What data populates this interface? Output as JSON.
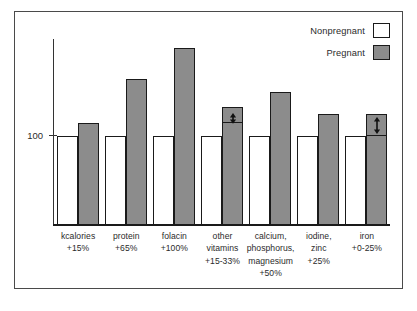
{
  "chart_data": {
    "type": "bar",
    "title": "",
    "subtitle": "",
    "xlabel": "",
    "ylabel": "",
    "ylim": [
      0,
      210
    ],
    "grid": false,
    "legend_position": "top-right",
    "y_ticks": [
      {
        "value": 100,
        "label": "100"
      }
    ],
    "baseline_value": 100,
    "categories": [
      "kcalories",
      "protein",
      "folacin",
      "other vitamins",
      "calcium, phosphorus, magnesium",
      "iodine, zinc",
      "iron"
    ],
    "series": [
      {
        "name": "Nonpregnant",
        "color": "#ffffff",
        "values": [
          100,
          100,
          100,
          100,
          100,
          100,
          100
        ]
      },
      {
        "name": "Pregnant",
        "color": "#8c8c8c",
        "values": [
          115,
          165,
          200,
          133,
          150,
          125,
          125
        ],
        "value_ranges": [
          null,
          null,
          null,
          [
            115,
            133
          ],
          null,
          null,
          [
            100,
            125
          ]
        ]
      }
    ],
    "increase_labels": [
      "+15%",
      "+65%",
      "+100%",
      "+15-33%",
      "+50%",
      "+25%",
      "+0-25%"
    ],
    "annotations": [
      {
        "category": "other vitamins",
        "type": "double-headed-arrow",
        "range": [
          115,
          133
        ],
        "note": "+15-33%"
      },
      {
        "category": "iron",
        "type": "double-headed-arrow",
        "range": [
          100,
          125
        ],
        "note": "+0-25%"
      }
    ]
  },
  "legend": {
    "items": [
      {
        "label": "Nonpregnant",
        "swatch": "white"
      },
      {
        "label": "Pregnant",
        "swatch": "gray"
      }
    ]
  },
  "axis": {
    "y_tick_label": "100"
  },
  "x_categories": [
    {
      "line1": "kcalories",
      "line2": "+15%",
      "line3": "",
      "line4": ""
    },
    {
      "line1": "protein",
      "line2": "+65%",
      "line3": "",
      "line4": ""
    },
    {
      "line1": "folacin",
      "line2": "+100%",
      "line3": "",
      "line4": ""
    },
    {
      "line1": "other",
      "line2": "vitamins",
      "line3": "+15-33%",
      "line4": ""
    },
    {
      "line1": "calcium,",
      "line2": "phosphorus,",
      "line3": "magnesium",
      "line4": "+50%"
    },
    {
      "line1": "iodine,",
      "line2": "zinc",
      "line3": "+25%",
      "line4": ""
    },
    {
      "line1": "iron",
      "line2": "+0-25%",
      "line3": "",
      "line4": ""
    }
  ],
  "colors": {
    "pregnant_fill": "#8c8c8c",
    "nonpregnant_fill": "#ffffff",
    "outline": "#1a1a1a",
    "frame": "#4a4a4a"
  }
}
